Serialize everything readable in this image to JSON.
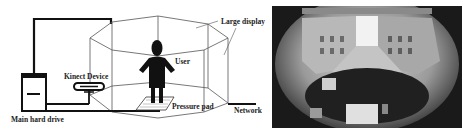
{
  "diagram": {
    "labels": {
      "large_display": "Large display",
      "user": "User",
      "kinect_device": "Kinect Device",
      "pressure_pad": "Pressure pad",
      "network": "Network",
      "main_hard_drive": "Main hard drive"
    },
    "colors": {
      "line": "#111111",
      "frame": "#555555",
      "figure": "#111111"
    }
  },
  "photo": {
    "description": "Fisheye view of immersive display room showing street scene and control desk"
  }
}
